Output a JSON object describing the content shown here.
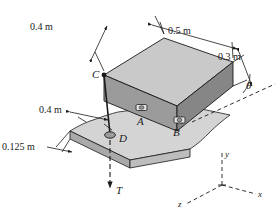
{
  "figure": {
    "dimensions": {
      "block_depth": "0.4 m",
      "block_length": "0.5 m",
      "block_height": "0.3 m",
      "plate_offset": "0.4 m",
      "plate_thickness": "0.125 m"
    },
    "points": {
      "a": "A",
      "b": "B",
      "c": "C",
      "d": "D"
    },
    "angle": {
      "symbol": "θ"
    },
    "force": {
      "label": "T"
    },
    "axes": {
      "x": "x",
      "y": "y",
      "z": "z"
    },
    "colors": {
      "top_face": "#c9c9c9",
      "left_face": "#9a9a9a",
      "right_face": "#8a8a8a",
      "plate_top": "#d2d2d2",
      "plate_edge": "#a8a8a8",
      "line": "#1a1a1a"
    }
  }
}
